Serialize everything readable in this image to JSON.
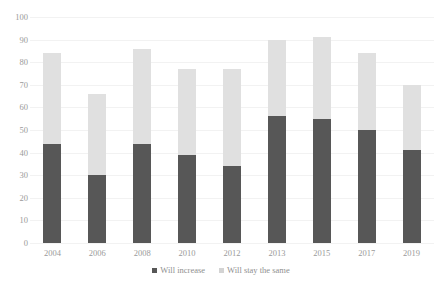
{
  "chart_data": {
    "type": "bar",
    "stacked": true,
    "title": "",
    "subtitle": "",
    "xlabel": "",
    "ylabel": "",
    "categories": [
      "2004",
      "2006",
      "2008",
      "2010",
      "2012",
      "2013",
      "2015",
      "2017",
      "2019"
    ],
    "series": [
      {
        "name": "Will increase",
        "color": "#575757",
        "values": [
          44,
          30,
          44,
          39,
          34,
          56,
          55,
          50,
          41
        ]
      },
      {
        "name": "Will stay the same",
        "color": "#e0e0e0",
        "values": [
          40,
          36,
          42,
          38,
          43,
          34,
          36,
          34,
          29
        ]
      }
    ],
    "totals": [
      84,
      66,
      86,
      77,
      77,
      90,
      91,
      84,
      70
    ],
    "ylim": [
      0,
      100
    ],
    "yticks": [
      "0",
      "10",
      "20",
      "30",
      "40",
      "50",
      "60",
      "70",
      "80",
      "90",
      "100"
    ],
    "ytick_values": [
      0,
      10,
      20,
      30,
      40,
      50,
      60,
      70,
      80,
      90,
      100
    ],
    "grid": true,
    "legend_position": "bottom"
  },
  "legend": {
    "items": [
      {
        "label": "Will increase",
        "color": "#575757"
      },
      {
        "label": "Will stay the same",
        "color": "#d3d3d3"
      }
    ]
  },
  "colors": {
    "increase": "#575757",
    "stay_same": "#e0e0e0",
    "gridline": "#f2f2f2",
    "tick_text": "#9a9a9a",
    "legend_text": "#8f8f8f",
    "background": "#ffffff"
  }
}
